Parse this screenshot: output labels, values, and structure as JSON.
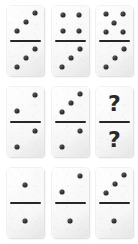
{
  "puzzle": {
    "type": "domino-sequence-puzzle",
    "grid": {
      "rows": 3,
      "columns": 3
    },
    "unknown_symbol": "?",
    "tiles": [
      {
        "id": "tile-1",
        "position": {
          "row": 1,
          "column": 1
        },
        "top": {
          "value": 3,
          "pattern": "diagonal-3",
          "label": "3"
        },
        "bottom": {
          "value": 3,
          "pattern": "diagonal-3",
          "label": "3"
        },
        "notation": "3|3"
      },
      {
        "id": "tile-2",
        "position": {
          "row": 1,
          "column": 2
        },
        "top": {
          "value": 4,
          "pattern": "square-4",
          "label": "4"
        },
        "bottom": {
          "value": 3,
          "pattern": "diagonal-3",
          "label": "3"
        },
        "notation": "4|3"
      },
      {
        "id": "tile-3",
        "position": {
          "row": 1,
          "column": 3
        },
        "top": {
          "value": 5,
          "pattern": "quincunx-5",
          "label": "5"
        },
        "bottom": {
          "value": 3,
          "pattern": "diagonal-3",
          "label": "3"
        },
        "notation": "5|3"
      },
      {
        "id": "tile-4",
        "position": {
          "row": 2,
          "column": 1
        },
        "top": {
          "value": 2,
          "pattern": "diagonal-2",
          "label": "2"
        },
        "bottom": {
          "value": 2,
          "pattern": "diagonal-2",
          "label": "2"
        },
        "notation": "2|2"
      },
      {
        "id": "tile-5",
        "position": {
          "row": 2,
          "column": 2
        },
        "top": {
          "value": 3,
          "pattern": "diagonal-3",
          "label": "3"
        },
        "bottom": {
          "value": 2,
          "pattern": "diagonal-2",
          "label": "2"
        },
        "notation": "3|2"
      },
      {
        "id": "tile-6",
        "position": {
          "row": 2,
          "column": 3
        },
        "top": {
          "value": null,
          "pattern": "question-mark",
          "label": "?"
        },
        "bottom": {
          "value": null,
          "pattern": "question-mark",
          "label": "?"
        },
        "notation": "?|?"
      },
      {
        "id": "tile-7",
        "position": {
          "row": 3,
          "column": 1
        },
        "top": {
          "value": 1,
          "pattern": "center-1",
          "label": "1"
        },
        "bottom": {
          "value": 1,
          "pattern": "center-1",
          "label": "1"
        },
        "notation": "1|1"
      },
      {
        "id": "tile-8",
        "position": {
          "row": 3,
          "column": 2
        },
        "top": {
          "value": 2,
          "pattern": "diagonal-2",
          "label": "2"
        },
        "bottom": {
          "value": 1,
          "pattern": "center-1",
          "label": "1"
        },
        "notation": "2|1"
      },
      {
        "id": "tile-9",
        "position": {
          "row": 3,
          "column": 3
        },
        "top": {
          "value": 3,
          "pattern": "diagonal-3",
          "label": "3"
        },
        "bottom": {
          "value": 1,
          "pattern": "center-1",
          "label": "1"
        },
        "notation": "3|1"
      }
    ]
  },
  "colors": {
    "page_background": "#ffffff",
    "tile_face": "#f7f7f7",
    "tile_edge": "#e6e6e6",
    "pip": "#262626",
    "divider": "#262626",
    "question_mark": "#2a2a2a"
  }
}
